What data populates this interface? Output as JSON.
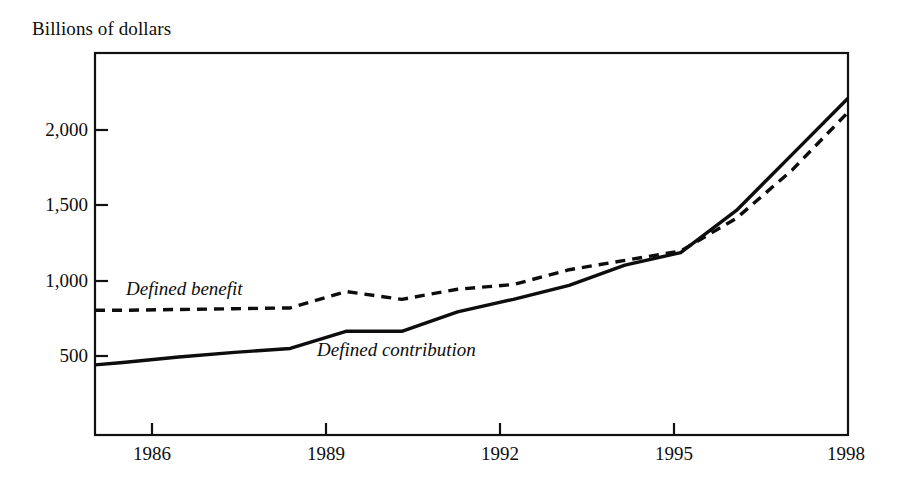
{
  "chart_data": {
    "type": "line",
    "title": "",
    "ylabel": "Billions of dollars",
    "xlabel": "",
    "xlim": [
      1984.5,
      1998
    ],
    "ylim": [
      0,
      2450
    ],
    "grid": false,
    "legend_position": "inline-annotations",
    "yticks": [
      500,
      1000,
      1500,
      2000
    ],
    "ytick_labels": [
      "500",
      "1,000",
      "1,500",
      "2,000"
    ],
    "xticks": [
      1986,
      1989,
      1992,
      1995,
      1998
    ],
    "xtick_labels": [
      "1986",
      "1989",
      "1992",
      "1995",
      "1998"
    ],
    "x": [
      1984.5,
      1985,
      1986,
      1987,
      1988,
      1989,
      1990,
      1991,
      1992,
      1993,
      1994,
      1995,
      1996,
      1997,
      1998
    ],
    "series": [
      {
        "name": "Defined benefit",
        "style": "dashed",
        "values": [
          800,
          800,
          805,
          810,
          815,
          920,
          870,
          935,
          965,
          1060,
          1120,
          1180,
          1390,
          1700,
          2070
        ]
      },
      {
        "name": "Defined contribution",
        "style": "solid",
        "values": [
          450,
          465,
          500,
          530,
          555,
          665,
          665,
          790,
          870,
          960,
          1090,
          1170,
          1440,
          1800,
          2160
        ]
      }
    ],
    "annotations": [
      {
        "text": "Defined benefit",
        "x": 1985.6,
        "y": 1060
      },
      {
        "text": "Defined contribution",
        "x": 1988.9,
        "y": 640
      }
    ],
    "colors": {
      "line": "#0d0d0d",
      "axis": "#111111",
      "background": "#ffffff"
    }
  }
}
